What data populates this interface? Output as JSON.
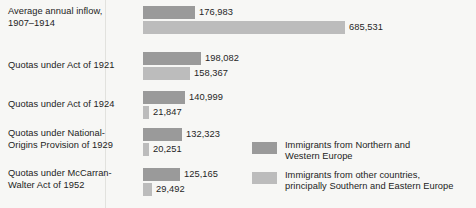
{
  "chart_data": {
    "type": "bar",
    "orientation": "horizontal",
    "title": "",
    "xlabel": "",
    "ylabel": "",
    "grid": false,
    "xlim": [
      0,
      685531
    ],
    "legend_position": "bottom-right",
    "categories": [
      "Average annual inflow, 1907–1914",
      "Quotas under Act of 1921",
      "Quotas under Act of 1924",
      "Quotas under National-Origins Provision of 1929",
      "Quotas under McCarran-Walter Act of 1952"
    ],
    "series": [
      {
        "name": "Immigrants from Northern and Western Europe",
        "color": "#9a9a9a",
        "values": [
          176983,
          198082,
          140999,
          132323,
          125165
        ],
        "value_labels": [
          "176,983",
          "198,082",
          "140,999",
          "132,323",
          "125,165"
        ]
      },
      {
        "name": "Immigrants from other countries, principally Southern and Eastern Europe",
        "color": "#bcbcbc",
        "values": [
          685531,
          158367,
          21847,
          20251,
          29492
        ],
        "value_labels": [
          "685,531",
          "158,367",
          "21,847",
          "20,251",
          "29,492"
        ]
      }
    ]
  },
  "rows": [
    {
      "label_line1": "Average annual inflow,",
      "label_line2": "1907–1914",
      "dark_value_label": "176,983",
      "light_value_label": "685,531"
    },
    {
      "label_line1": "Quotas under Act of 1921",
      "label_line2": "",
      "dark_value_label": "198,082",
      "light_value_label": "158,367"
    },
    {
      "label_line1": "Quotas under Act of 1924",
      "label_line2": "",
      "dark_value_label": "140,999",
      "light_value_label": "21,847"
    },
    {
      "label_line1": "Quotas under National-",
      "label_line2": "Origins Provision of 1929",
      "dark_value_label": "132,323",
      "light_value_label": "20,251"
    },
    {
      "label_line1": "Quotas under McCarran-",
      "label_line2": "Walter Act of 1952",
      "dark_value_label": "125,165",
      "light_value_label": "29,492"
    }
  ],
  "legend": {
    "items": [
      {
        "swatch": "dark",
        "color": "#9a9a9a",
        "line1": "Immigrants from Northern and",
        "line2": "Western Europe"
      },
      {
        "swatch": "light",
        "color": "#bcbcbc",
        "line1": "Immigrants from other countries,",
        "line2": "principally Southern and Eastern Europe"
      }
    ]
  }
}
